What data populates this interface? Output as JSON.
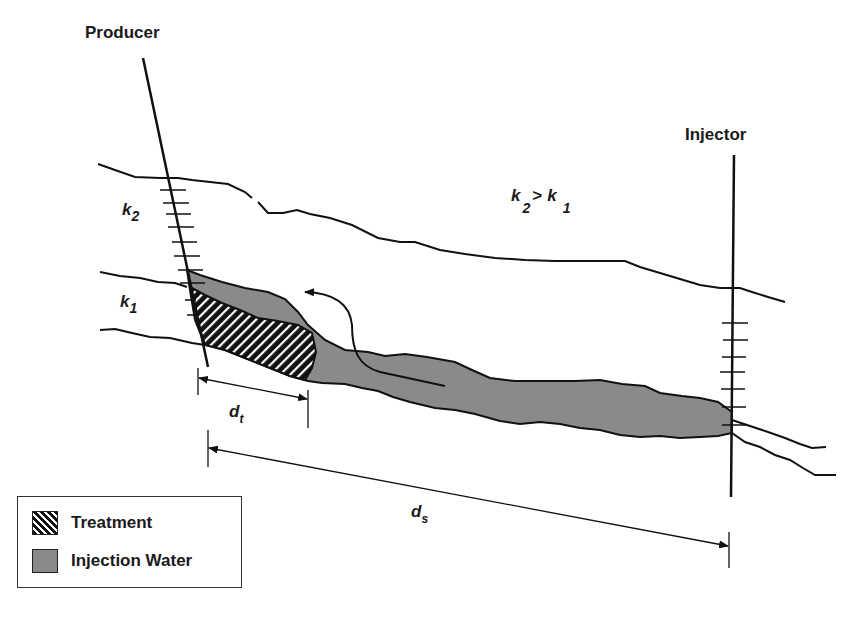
{
  "diagram": {
    "wells": {
      "producer": {
        "label": "Producer"
      },
      "injector": {
        "label": "Injector"
      }
    },
    "layers": {
      "upper": {
        "symbol": "k",
        "subscript": "2"
      },
      "lower": {
        "symbol": "k",
        "subscript": "1"
      },
      "relation": {
        "left_symbol": "k",
        "left_sub": "2",
        "operator": ">",
        "right_symbol": "k",
        "right_sub": "1"
      }
    },
    "dimensions": {
      "treatment_distance": {
        "symbol": "d",
        "subscript": "t"
      },
      "well_spacing": {
        "symbol": "d",
        "subscript": "s"
      }
    },
    "legend": {
      "items": [
        {
          "label": "Treatment",
          "pattern": "diagonal-hatch"
        },
        {
          "label": "Injection Water",
          "color": "#8a8a8a"
        }
      ]
    },
    "colors": {
      "line": "#111111",
      "injection_water": "#8a8a8a",
      "treatment_hatch": "#111111"
    }
  }
}
